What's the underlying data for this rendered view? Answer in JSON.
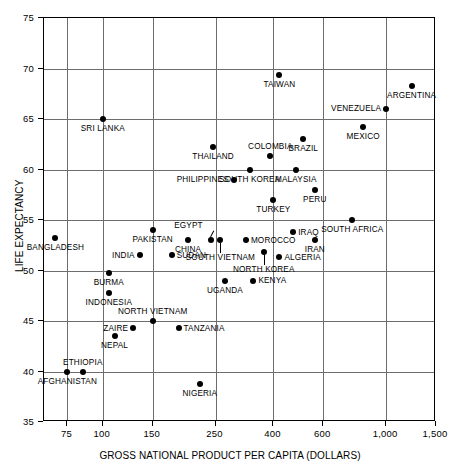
{
  "chart_data": {
    "type": "scatter",
    "title": "",
    "xlabel": "GROSS NATIONAL PRODUCT PER CAPITA (DOLLARS)",
    "ylabel": "LIFE EXPECTANCY",
    "xscale": "log",
    "xlim": [
      62,
      1500
    ],
    "ylim": [
      35,
      75
    ],
    "xticks": [
      75,
      100,
      150,
      250,
      400,
      600,
      1000,
      1500
    ],
    "xticklabels": [
      "75",
      "100",
      "150",
      "250",
      "400",
      "600",
      "1,000",
      "1,500"
    ],
    "yticks": [
      35,
      40,
      45,
      50,
      55,
      60,
      65,
      70,
      75
    ],
    "yticklabels": [
      "35",
      "40",
      "45",
      "50",
      "55",
      "60",
      "65",
      "70",
      "75"
    ],
    "grid": true,
    "grid_color": "#6d6d6d",
    "marker_color": "#000000",
    "points": [
      {
        "name": "SRI LANKA",
        "x": 100,
        "y": 65.0,
        "label_pos": "below-center"
      },
      {
        "name": "TAIWAN",
        "x": 420,
        "y": 69.4,
        "label_pos": "below-center"
      },
      {
        "name": "ARGENTINA",
        "x": 1230,
        "y": 68.3,
        "label_pos": "below-center"
      },
      {
        "name": "VENEZUELA",
        "x": 1000,
        "y": 66.0,
        "label_pos": "left"
      },
      {
        "name": "MEXICO",
        "x": 830,
        "y": 64.2,
        "label_pos": "below-center"
      },
      {
        "name": "BRAZIL",
        "x": 510,
        "y": 63.0,
        "label_pos": "below-center"
      },
      {
        "name": "THAILAND",
        "x": 245,
        "y": 62.2,
        "label_pos": "below-center"
      },
      {
        "name": "COLOMBIA",
        "x": 390,
        "y": 61.3,
        "label_pos": "above-center"
      },
      {
        "name": "MALAYSIA",
        "x": 480,
        "y": 60.0,
        "label_pos": "below-center"
      },
      {
        "name": "SOUTH KOREA",
        "x": 330,
        "y": 60.0,
        "label_pos": "below-center"
      },
      {
        "name": "PHILIPPINES",
        "x": 290,
        "y": 59.0,
        "label_pos": "left"
      },
      {
        "name": "PERU",
        "x": 560,
        "y": 58.0,
        "label_pos": "below-center"
      },
      {
        "name": "TURKEY",
        "x": 400,
        "y": 57.0,
        "label_pos": "below-center"
      },
      {
        "name": "SOUTH AFRICA",
        "x": 760,
        "y": 55.0,
        "label_pos": "below-center"
      },
      {
        "name": "PAKISTAN",
        "x": 150,
        "y": 54.0,
        "label_pos": "below-center"
      },
      {
        "name": "IRAQ",
        "x": 470,
        "y": 53.8,
        "label_pos": "right"
      },
      {
        "name": "EGYPT",
        "x": 240,
        "y": 53.0,
        "label_pos": "leader-up-left"
      },
      {
        "name": "CHINA",
        "x": 200,
        "y": 53.0,
        "label_pos": "below-center"
      },
      {
        "name": "SOUTH VIETNAM",
        "x": 260,
        "y": 53.0,
        "label_pos": "leader-down"
      },
      {
        "name": "MOROCCO",
        "x": 320,
        "y": 53.0,
        "label_pos": "right"
      },
      {
        "name": "BANGLADESH",
        "x": 68,
        "y": 53.2,
        "label_pos": "below-center"
      },
      {
        "name": "IRAN",
        "x": 560,
        "y": 53.0,
        "label_pos": "below-center"
      },
      {
        "name": "INDIA",
        "x": 135,
        "y": 51.5,
        "label_pos": "left"
      },
      {
        "name": "SUDAN",
        "x": 175,
        "y": 51.5,
        "label_pos": "right"
      },
      {
        "name": "NORTH KOREA",
        "x": 370,
        "y": 51.8,
        "label_pos": "leader-down"
      },
      {
        "name": "ALGERIA",
        "x": 420,
        "y": 51.3,
        "label_pos": "right"
      },
      {
        "name": "BURMA",
        "x": 105,
        "y": 49.8,
        "label_pos": "below-center"
      },
      {
        "name": "UGANDA",
        "x": 270,
        "y": 49.0,
        "label_pos": "below-center"
      },
      {
        "name": "KENYA",
        "x": 340,
        "y": 49.0,
        "label_pos": "right"
      },
      {
        "name": "INDONESIA",
        "x": 105,
        "y": 47.8,
        "label_pos": "below-center"
      },
      {
        "name": "NORTH VIETNAM",
        "x": 150,
        "y": 45.0,
        "label_pos": "above-center"
      },
      {
        "name": "ZAIRE",
        "x": 128,
        "y": 44.3,
        "label_pos": "left"
      },
      {
        "name": "TANZANIA",
        "x": 185,
        "y": 44.3,
        "label_pos": "right"
      },
      {
        "name": "NEPAL",
        "x": 110,
        "y": 43.5,
        "label_pos": "below-center"
      },
      {
        "name": "AFGHANISTAN",
        "x": 75,
        "y": 40.0,
        "label_pos": "below-center"
      },
      {
        "name": "ETHIOPIA",
        "x": 85,
        "y": 40.0,
        "label_pos": "above-center"
      },
      {
        "name": "NIGERIA",
        "x": 220,
        "y": 38.8,
        "label_pos": "below-center"
      }
    ]
  }
}
